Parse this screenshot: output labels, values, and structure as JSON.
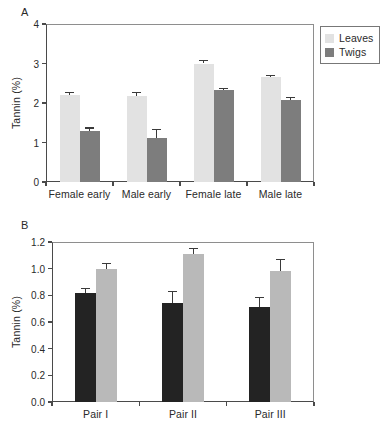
{
  "figure": {
    "panels": [
      {
        "letter": "A",
        "ylabel": "Tannin (%)",
        "yticks": [
          "0",
          "1",
          "2",
          "3",
          "4"
        ]
      },
      {
        "letter": "B",
        "ylabel": "Tannin (%)",
        "yticks": [
          "0.0",
          "0.2",
          "0.4",
          "0.6",
          "0.8",
          "1.0",
          "1.2"
        ]
      }
    ]
  },
  "chart_data": [
    {
      "panel": "A",
      "type": "bar",
      "title": "",
      "xlabel": "",
      "ylabel": "Tannin (%)",
      "ylim": [
        0,
        4
      ],
      "yticks": [
        0,
        1,
        2,
        3,
        4
      ],
      "ytick_labels": [
        "0",
        "1",
        "2",
        "3",
        "4"
      ],
      "grid": false,
      "legend_position": "outside-top-right",
      "categories": [
        "Female early",
        "Male early",
        "Female late",
        "Male late"
      ],
      "series": [
        {
          "name": "Leaves",
          "color": "#e2e2e2",
          "values": [
            2.2,
            2.18,
            3.0,
            2.65
          ],
          "errors": [
            0.07,
            0.1,
            0.09,
            0.07
          ]
        },
        {
          "name": "Twigs",
          "color": "#7d7d7d",
          "values": [
            1.29,
            1.12,
            2.32,
            2.08
          ],
          "errors": [
            0.09,
            0.23,
            0.07,
            0.07
          ]
        }
      ]
    },
    {
      "panel": "B",
      "type": "bar",
      "title": "",
      "xlabel": "",
      "ylabel": "Tannin (%)",
      "ylim": [
        0,
        1.2
      ],
      "yticks": [
        0,
        0.2,
        0.4,
        0.6,
        0.8,
        1.0,
        1.2
      ],
      "ytick_labels": [
        "0.0",
        "0.2",
        "0.4",
        "0.6",
        "0.8",
        "1.0",
        "1.2"
      ],
      "grid": false,
      "legend_position": "outside-top-right",
      "categories": [
        "Pair I",
        "Pair II",
        "Pair III"
      ],
      "series": [
        {
          "name": "Shade",
          "color": "#232323",
          "values": [
            0.82,
            0.745,
            0.715
          ],
          "errors": [
            0.035,
            0.085,
            0.07
          ]
        },
        {
          "name": "Control",
          "color": "#b9b9b9",
          "values": [
            1.0,
            1.11,
            0.985
          ],
          "errors": [
            0.04,
            0.045,
            0.085
          ]
        }
      ]
    }
  ]
}
